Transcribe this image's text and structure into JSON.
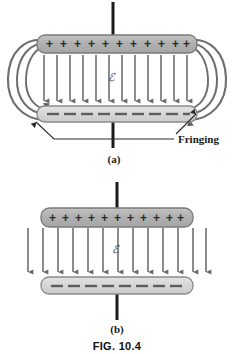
{
  "figure": {
    "caption": "FIG. 10.4",
    "panels": [
      {
        "id": "a",
        "label": "(a)",
        "description": "Parallel plate capacitor with fringing field at the edges",
        "top_plate": {
          "charge_sign": "+",
          "charge_count": 11,
          "glyph": "+",
          "x": 37,
          "y": 35,
          "width": 160,
          "height": 18,
          "fill": "#b4b4b4",
          "stroke": "#7a7a7a"
        },
        "bottom_plate": {
          "charge_sign": "-",
          "charge_count": 10,
          "glyph": "–",
          "x": 37,
          "y": 107,
          "width": 160,
          "height": 16,
          "fill": "#d8d8d8",
          "stroke": "#8a8a8a"
        },
        "field_lines": {
          "count": 12,
          "direction": "down",
          "color": "#707070",
          "x_start": 43,
          "x_end": 190,
          "y_top": 55,
          "y_bottom": 105
        },
        "field_symbol": "ℰ",
        "fringing_curves_per_side": 3,
        "terminal_top": {
          "x": 113,
          "y_top": 2,
          "y_bottom": 36
        },
        "terminal_bottom": {
          "x": 113,
          "y_top": 122,
          "y_bottom": 148
        },
        "annotation": {
          "label": "Fringing",
          "text_x": 176,
          "text_y": 140
        }
      },
      {
        "id": "b",
        "label": "(b)",
        "description": "Idealized parallel plate capacitor with uniform field, no fringing",
        "top_plate": {
          "charge_sign": "+",
          "charge_count": 11,
          "glyph": "+",
          "x": 41,
          "y": 208,
          "width": 152,
          "height": 18,
          "fill": "#b4b4b4",
          "stroke": "#7a7a7a"
        },
        "bottom_plate": {
          "charge_sign": "-",
          "charge_count": 10,
          "glyph": "–",
          "x": 41,
          "y": 278,
          "width": 152,
          "height": 16,
          "fill": "#d8d8d8",
          "stroke": "#8a8a8a"
        },
        "field_lines": {
          "count": 13,
          "direction": "down",
          "color": "#707070",
          "x_start": 27,
          "x_end": 207,
          "y_top": 228,
          "y_bottom": 276
        },
        "field_symbol": "ℰ",
        "fringing_curves_per_side": 0,
        "terminal_top": {
          "x": 117,
          "y_top": 182,
          "y_bottom": 209
        },
        "terminal_bottom": {
          "x": 117,
          "y_top": 293,
          "y_bottom": 320
        }
      }
    ]
  },
  "colors": {
    "background": "#ffffff",
    "plate_positive_fill": "#b4b4b4",
    "plate_negative_fill": "#d8d8d8",
    "plate_stroke": "#828282",
    "field_line": "#707070",
    "fringe_curve": "#6e6e6e",
    "terminal": "#1a1a1a",
    "text": "#111111"
  }
}
